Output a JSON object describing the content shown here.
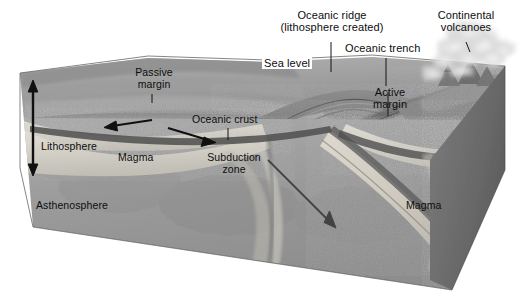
{
  "figure": {
    "type": "geological-block-diagram",
    "style": "grayscale-airbrush-illustration",
    "width": 520,
    "height": 298
  },
  "callout_labels": {
    "oceanic_ridge_line1": "Oceanic ridge",
    "oceanic_ridge_line2": "(lithosphere created)",
    "continental_volcanoes_line1": "Continental",
    "continental_volcanoes_line2": "volcanoes",
    "oceanic_trench": "Oceanic trench",
    "sea_level": "Sea level",
    "active_margin_line1": "Active",
    "active_margin_line2": "margin"
  },
  "inner_labels": {
    "passive_margin_line1": "Passive",
    "passive_margin_line2": "margin",
    "oceanic_crust": "Oceanic crust",
    "lithosphere": "Lithosphere",
    "magma_left": "Magma",
    "subduction_zone_line1": "Subduction",
    "subduction_zone_line2": "zone",
    "asthenosphere": "Asthenosphere",
    "magma_right": "Magma"
  },
  "annotations": {
    "lithosphere_thickness_arrow": "double-headed-vertical-arrow",
    "spreading_arrow_left": "left-pointing-arrow",
    "spreading_arrow_right": "right-pointing-arrow",
    "subducting_slab_arrow": "down-right-diagonal-arrow",
    "volcano_plume": "eruption-smoke-plume"
  },
  "colors": {
    "background": "#ffffff",
    "text": "#0d0d0d",
    "leader_line": "#1a1a1a",
    "ocean_surface_light": "#a9a9a9",
    "ocean_surface_mid": "#8e8e8e",
    "ocean_surface_dark": "#747474",
    "block_left_face": "#9a9a9a",
    "block_right_face": "#6f6f6f",
    "lithosphere_band": "#d7d4cc",
    "asthenosphere": "#9c9c9c",
    "crust_dark": "#5c5c5c",
    "magma_light": "#dedbd2",
    "plume_smoke": "#d2d2d2"
  }
}
